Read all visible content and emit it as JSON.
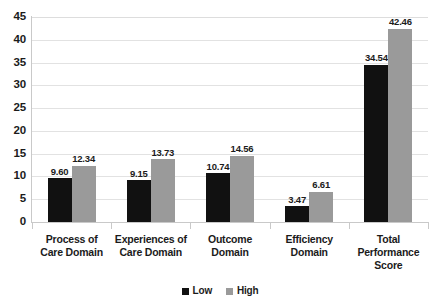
{
  "chart_data": {
    "type": "bar",
    "title": "",
    "subtitle": "",
    "xlabel": "",
    "ylabel": "",
    "ylim": [
      0,
      45
    ],
    "ytick_step": 5,
    "yticks": [
      "45",
      "40",
      "35",
      "30",
      "25",
      "20",
      "15",
      "10",
      "5",
      "0"
    ],
    "grid": true,
    "legend_position": "bottom-center",
    "categories": [
      "Process of\nCare Domain",
      "Experiences of\nCare Domain",
      "Outcome\nDomain",
      "Efficiency\nDomain",
      "Total\nPerformance\nScore"
    ],
    "category_lines": [
      [
        "Process of",
        "Care Domain"
      ],
      [
        "Experiences of",
        "Care Domain"
      ],
      [
        "Outcome",
        "Domain"
      ],
      [
        "Efficiency",
        "Domain"
      ],
      [
        "Total",
        "Performance",
        "Score"
      ]
    ],
    "series": [
      {
        "name": "Low",
        "color": "#111111",
        "values": [
          9.6,
          9.15,
          10.74,
          3.47,
          34.54
        ],
        "labels": [
          "9.60",
          "9.15",
          "10.74",
          "3.47",
          "34.54"
        ]
      },
      {
        "name": "High",
        "color": "#9a9a9a",
        "values": [
          12.34,
          13.73,
          14.56,
          6.61,
          42.46
        ],
        "labels": [
          "12.34",
          "13.73",
          "14.56",
          "6.61",
          "42.46"
        ]
      }
    ]
  },
  "legend": {
    "items": [
      {
        "label": "Low",
        "color": "#111111"
      },
      {
        "label": "High",
        "color": "#9a9a9a"
      }
    ]
  },
  "colors": {
    "background": "#ffffff",
    "axis": "#c9c9c9",
    "gridline": "#e2e2e2",
    "text": "#1b1b1b",
    "series_low": "#111111",
    "series_high": "#9a9a9a"
  }
}
